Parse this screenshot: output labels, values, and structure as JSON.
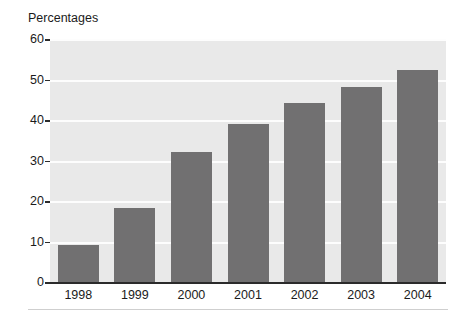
{
  "chart_data": {
    "type": "bar",
    "title": "Percentages",
    "xlabel": "",
    "ylabel": "Percentages",
    "categories": [
      "1998",
      "1999",
      "2000",
      "2001",
      "2002",
      "2003",
      "2004"
    ],
    "values": [
      9.3,
      18.5,
      32.3,
      39.3,
      44.5,
      48.3,
      52.5
    ],
    "series": [
      {
        "name": "Percentages",
        "values": [
          9.3,
          18.5,
          32.3,
          39.3,
          44.5,
          48.3,
          52.5
        ]
      }
    ],
    "ylim": [
      0,
      60
    ],
    "yticks": [
      0,
      10,
      20,
      30,
      40,
      50,
      60
    ],
    "ytick_labels": [
      "0",
      "10",
      "20",
      "30",
      "40",
      "50",
      "60"
    ],
    "grid": true,
    "grid_axis": "y",
    "legend": false,
    "legend_position": "none",
    "colors": {
      "bar_fill": "#717071",
      "plot_background": "#e9e9e9",
      "gridline": "#fdfdfd",
      "axis": "#2b2b2b",
      "text": "#1b1b1b",
      "figure_background": "#ffffff",
      "bottom_rule": "#cfcfcf"
    }
  }
}
